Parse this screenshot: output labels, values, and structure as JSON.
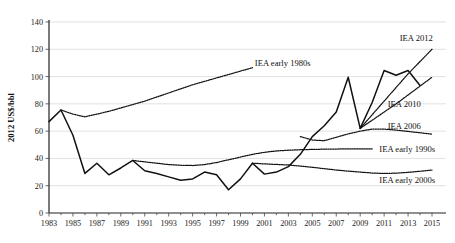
{
  "chart_data": {
    "type": "line",
    "title": "",
    "subtitle": "",
    "xlabel": "",
    "ylabel": "2012 US$/bbl",
    "xlim": [
      1983,
      2015
    ],
    "ylim": [
      0,
      140
    ],
    "yticks": [
      0,
      20,
      40,
      60,
      80,
      100,
      120,
      140
    ],
    "xticks": [
      1983,
      1985,
      1987,
      1989,
      1991,
      1993,
      1995,
      1997,
      1999,
      2001,
      2003,
      2005,
      2007,
      2009,
      2011,
      2013,
      2015
    ],
    "xtick_labels": [
      "1983",
      "1985",
      "1987",
      "1989",
      "1991",
      "1993",
      "1995",
      "1997",
      "1999",
      "2001",
      "2003",
      "2005",
      "2007",
      "2009",
      "2011",
      "2013",
      "2015"
    ],
    "ytick_labels": [
      "0",
      "20",
      "40",
      "60",
      "80",
      "100",
      "120",
      "140"
    ],
    "x_minor_tick_interval": 1,
    "grid": "horizontal",
    "legend": "inline-labels",
    "series": [
      {
        "name": "Historical crude oil price",
        "style": "solid",
        "label": "",
        "x": [
          1983,
          1984,
          1985,
          1986,
          1987,
          1988,
          1989,
          1990,
          1991,
          1992,
          1993,
          1994,
          1995,
          1996,
          1997,
          1998,
          1999,
          2000,
          2001,
          2002,
          2003,
          2004,
          2005,
          2006,
          2007,
          2008,
          2009,
          2010,
          2011,
          2012,
          2013,
          2014,
          2015
        ],
        "values": [
          67,
          75.5,
          57,
          29,
          36.5,
          28,
          33,
          38.5,
          31,
          29,
          26.5,
          24,
          25,
          30,
          28,
          17,
          25,
          36.5,
          28.5,
          30,
          34,
          43,
          56,
          64,
          74,
          99.5,
          62,
          81,
          104.5,
          101,
          104.5,
          93.5,
          null
        ]
      },
      {
        "name": "IEA early 1980s",
        "style": "dotted",
        "label": "IEA early 1980s",
        "label_x": 2000.2,
        "label_y": 110,
        "x": [
          1984,
          1985,
          1986,
          1987,
          1988,
          1989,
          1990,
          1991,
          1992,
          1993,
          1994,
          1995,
          1996,
          1997,
          1998,
          1999,
          2000
        ],
        "values": [
          75.5,
          72.5,
          70.5,
          72.5,
          74.5,
          77,
          79.5,
          82,
          85,
          88,
          91,
          94,
          96.5,
          99,
          101.5,
          104,
          106.5
        ]
      },
      {
        "name": "IEA early 1990s",
        "style": "dotted",
        "label": "IEA early 1990s",
        "label_x": 2010.6,
        "label_y": 47,
        "x": [
          1990,
          1991,
          1992,
          1993,
          1994,
          1995,
          1996,
          1997,
          1998,
          1999,
          2000,
          2001,
          2002,
          2003,
          2004,
          2005,
          2006,
          2007,
          2008,
          2009,
          2010
        ],
        "values": [
          38.5,
          37.5,
          36.5,
          35.5,
          35,
          34.8,
          35.5,
          37,
          39,
          41,
          43,
          44.5,
          45.5,
          46,
          46.4,
          46.6,
          46.8,
          46.9,
          47,
          47,
          47
        ]
      },
      {
        "name": "IEA early 2000s",
        "style": "dotted",
        "label": "IEA early 2000s",
        "label_x": 2010.6,
        "label_y": 24,
        "x": [
          2000,
          2001,
          2002,
          2003,
          2004,
          2005,
          2006,
          2007,
          2008,
          2009,
          2010,
          2011,
          2012,
          2013,
          2014,
          2015
        ],
        "values": [
          36.5,
          36,
          35.6,
          35.2,
          34.4,
          33.5,
          32.5,
          31.5,
          30.7,
          30,
          29.3,
          29,
          29.2,
          29.8,
          30.6,
          31.5
        ]
      },
      {
        "name": "IEA 2006",
        "style": "dotted",
        "label": "IEA 2006",
        "label_x": 2011.3,
        "label_y": 64,
        "x": [
          2004,
          2005,
          2006,
          2007,
          2008,
          2009,
          2010,
          2011,
          2012,
          2013,
          2014,
          2015
        ],
        "values": [
          56,
          53.5,
          53,
          55.5,
          58,
          60,
          61.5,
          61.5,
          60.8,
          59.8,
          58.8,
          57.8
        ]
      },
      {
        "name": "IEA 2010",
        "style": "dotted",
        "label": "IEA 2010",
        "label_x": 2011.3,
        "label_y": 80,
        "x": [
          2009,
          2010,
          2011,
          2012,
          2013,
          2014,
          2015
        ],
        "values": [
          62,
          68,
          74,
          80,
          86.5,
          93,
          99.5
        ]
      },
      {
        "name": "IEA 2012",
        "style": "dotted",
        "label": "IEA 2012",
        "label_x": 2012.3,
        "label_y": 128,
        "x": [
          2009,
          2010,
          2011,
          2012,
          2013,
          2014,
          2015
        ],
        "values": [
          62,
          72,
          82,
          92,
          102,
          111,
          120
        ]
      }
    ]
  },
  "colors": {
    "line": "#111111",
    "grid": "#d9d9d9",
    "axis": "#222222",
    "background": "#ffffff"
  }
}
